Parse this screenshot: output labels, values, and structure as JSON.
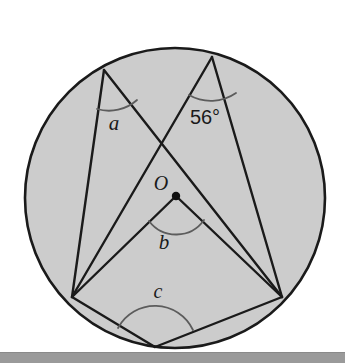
{
  "figure": {
    "background_color": "#ffffff",
    "circle": {
      "name": "circle-O",
      "cx": 175,
      "cy": 198,
      "r": 150,
      "fill_color": "#cccccc",
      "stroke_color": "#1a1a1a",
      "stroke_width": 2.6
    },
    "points": {
      "center": {
        "label": "O",
        "x": 176,
        "y": 196
      },
      "top_left": {
        "label": "",
        "x": 104,
        "y": 70
      },
      "top_right": {
        "label": "",
        "x": 212,
        "y": 57
      },
      "bottom_left": {
        "label": "",
        "x": 72,
        "y": 297
      },
      "bottom_right": {
        "label": "",
        "x": 282,
        "y": 297
      },
      "bottom": {
        "label": "",
        "x": 155,
        "y": 347
      }
    },
    "center_dot": {
      "name": "center-point-O",
      "x": 176,
      "y": 196,
      "r": 4.2,
      "color": "#111111"
    },
    "chords": [
      {
        "name": "chord-topleft-bottomleft",
        "x1": 104,
        "y1": 70,
        "x2": 72,
        "y2": 297
      },
      {
        "name": "chord-topleft-bottomright",
        "x1": 104,
        "y1": 70,
        "x2": 282,
        "y2": 297
      },
      {
        "name": "chord-topright-bottomleft",
        "x1": 212,
        "y1": 57,
        "x2": 72,
        "y2": 297
      },
      {
        "name": "chord-topright-bottomright",
        "x1": 212,
        "y1": 57,
        "x2": 282,
        "y2": 297
      },
      {
        "name": "radius-O-bottomleft",
        "x1": 176,
        "y1": 196,
        "x2": 72,
        "y2": 297
      },
      {
        "name": "radius-O-bottomright",
        "x1": 176,
        "y1": 196,
        "x2": 282,
        "y2": 297
      },
      {
        "name": "chord-bottomleft-bottom",
        "x1": 72,
        "y1": 297,
        "x2": 155,
        "y2": 347
      },
      {
        "name": "chord-bottomright-bottom",
        "x1": 282,
        "y1": 297,
        "x2": 155,
        "y2": 347
      }
    ],
    "angle_marks": [
      {
        "name": "angle-arc-a",
        "path": "M 97 109 A 42 42 0 0 0 137 100",
        "stroke_color": "#5c5c5c"
      },
      {
        "name": "angle-arc-56",
        "path": "M 189 95 A 44 44 0 0 0 236 93",
        "stroke_color": "#5c5c5c"
      },
      {
        "name": "angle-arc-b",
        "path": "M 149 221 A 34 34 0 0 0 204 220",
        "stroke_color": "#5c5c5c"
      },
      {
        "name": "angle-arc-c",
        "path": "M 118 328 A 42 42 0 0 1 193 330",
        "stroke_color": "#5c5c5c"
      }
    ],
    "labels": [
      {
        "name": "label-angle-a",
        "text": "a",
        "x": 114,
        "y": 130,
        "size": 21,
        "italic": true
      },
      {
        "name": "label-angle-56",
        "text": "56°",
        "x": 205,
        "y": 124,
        "size": 20,
        "italic": false
      },
      {
        "name": "label-center-O",
        "text": "O",
        "x": 161,
        "y": 190,
        "size": 20,
        "italic": true
      },
      {
        "name": "label-angle-b",
        "text": "b",
        "x": 164,
        "y": 249,
        "size": 21,
        "italic": true
      },
      {
        "name": "label-angle-c",
        "text": "c",
        "x": 158,
        "y": 298,
        "size": 20,
        "italic": true
      }
    ],
    "bottom_bar": {
      "name": "page-footer-bar",
      "top": 352,
      "height": 10,
      "color": "#9a9a9a"
    }
  }
}
